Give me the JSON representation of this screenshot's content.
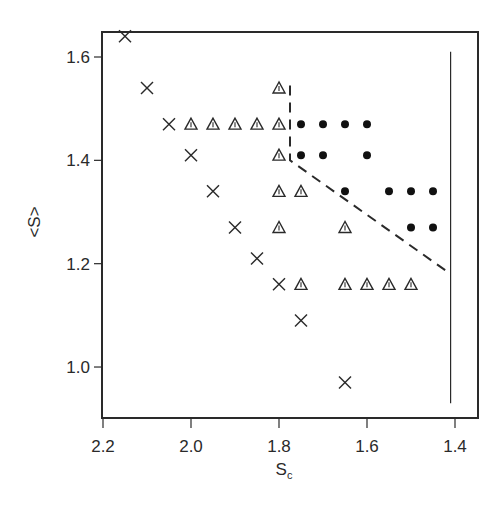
{
  "chart_data": {
    "type": "scatter",
    "title": "",
    "xlabel": "S_c",
    "xlabel_main": "S",
    "xlabel_sub": "c",
    "ylabel": "<S>",
    "xlim": [
      2.2,
      1.345
    ],
    "x_reversed": true,
    "ylim": [
      0.9,
      1.643
    ],
    "x_ticks": [
      2.2,
      2.0,
      1.8,
      1.6,
      1.4
    ],
    "x_tick_labels": [
      "2.2",
      "2.0",
      "1.8",
      "1.6",
      "1.4"
    ],
    "y_ticks": [
      1.0,
      1.2,
      1.4,
      1.6
    ],
    "y_tick_labels": [
      "1.0",
      "1.2",
      "1.4",
      "1.6"
    ],
    "grid": false,
    "legend": null,
    "series": [
      {
        "name": "cross",
        "marker": "x",
        "points": [
          [
            2.15,
            1.64
          ],
          [
            2.1,
            1.54
          ],
          [
            2.05,
            1.47
          ],
          [
            2.0,
            1.41
          ],
          [
            1.95,
            1.34
          ],
          [
            1.9,
            1.27
          ],
          [
            1.85,
            1.21
          ],
          [
            1.8,
            1.16
          ],
          [
            1.75,
            1.09
          ],
          [
            1.65,
            0.97
          ]
        ]
      },
      {
        "name": "triangle",
        "marker": "triangle",
        "points": [
          [
            1.8,
            1.54
          ],
          [
            2.0,
            1.47
          ],
          [
            1.95,
            1.47
          ],
          [
            1.9,
            1.47
          ],
          [
            1.85,
            1.47
          ],
          [
            1.8,
            1.47
          ],
          [
            1.8,
            1.41
          ],
          [
            1.8,
            1.34
          ],
          [
            1.75,
            1.34
          ],
          [
            1.8,
            1.27
          ],
          [
            1.65,
            1.27
          ],
          [
            1.75,
            1.16
          ],
          [
            1.65,
            1.16
          ],
          [
            1.6,
            1.16
          ],
          [
            1.55,
            1.16
          ],
          [
            1.5,
            1.16
          ]
        ]
      },
      {
        "name": "dot",
        "marker": "filled-circle",
        "points": [
          [
            1.75,
            1.47
          ],
          [
            1.7,
            1.47
          ],
          [
            1.65,
            1.47
          ],
          [
            1.6,
            1.47
          ],
          [
            1.75,
            1.41
          ],
          [
            1.7,
            1.41
          ],
          [
            1.6,
            1.41
          ],
          [
            1.65,
            1.34
          ],
          [
            1.55,
            1.34
          ],
          [
            1.5,
            1.34
          ],
          [
            1.45,
            1.34
          ],
          [
            1.5,
            1.27
          ],
          [
            1.45,
            1.27
          ]
        ]
      }
    ],
    "lines": [
      {
        "name": "dashed-boundary",
        "style": "dashed",
        "points": [
          [
            1.775,
            1.545
          ],
          [
            1.775,
            1.4
          ],
          [
            1.41,
            1.18
          ]
        ]
      },
      {
        "name": "solid-vertical",
        "style": "solid",
        "points": [
          [
            1.41,
            1.61
          ],
          [
            1.41,
            0.93
          ]
        ]
      }
    ]
  },
  "colors": {
    "ink": "#2a2a2a",
    "background": "#ffffff"
  },
  "layout": {
    "plot_left": 102,
    "plot_top": 32,
    "plot_right": 478,
    "plot_bottom": 418
  }
}
